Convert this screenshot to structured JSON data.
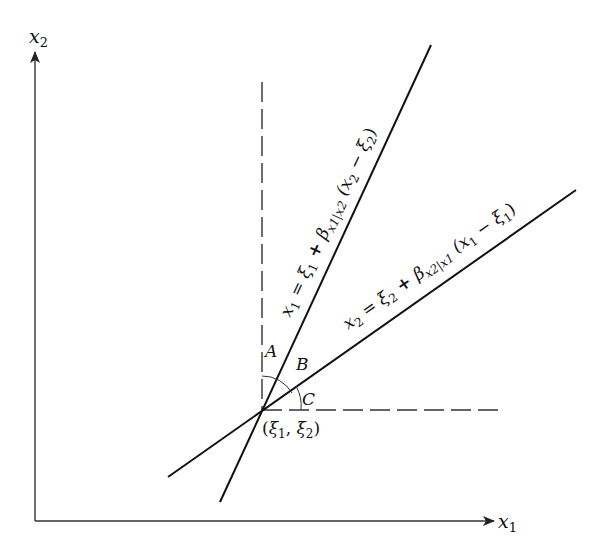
{
  "diagram": {
    "axes": {
      "x_label": "x",
      "x_label_sub": "1",
      "y_label": "x",
      "y_label_sub": "2"
    },
    "point_label": "(ξ1, ξ2)",
    "point_label_parts": {
      "open": "(",
      "xi1": "ξ",
      "sub1": "1",
      "comma": ", ",
      "xi2": "ξ",
      "sub2": "2",
      "close": ")"
    },
    "angles": {
      "A": "A",
      "B": "B",
      "C": "C"
    },
    "line1": {
      "equation": "x1 = ξ1 + βx1|x2 (x2 − ξ2)",
      "parts": {
        "lhs": "x",
        "lhs_sub": "1",
        "eq": " = ",
        "xi": "ξ",
        "xi_sub": "1",
        "plus": " + ",
        "beta": "β",
        "beta_sub": "x1|x2",
        "paren_open": " (x",
        "x_sub": "2",
        "minus": " − ξ",
        "minus_sub": "2",
        "paren_close": ")"
      }
    },
    "line2": {
      "equation": "x2 = ξ2 + βx2|x1 (x1 − ξ1)",
      "parts": {
        "lhs": "x",
        "lhs_sub": "2",
        "eq": " = ",
        "xi": "ξ",
        "xi_sub": "2",
        "plus": " + ",
        "beta": "β",
        "beta_sub": "x2|x1",
        "paren_open": " (x",
        "x_sub": "1",
        "minus": " − ξ",
        "minus_sub": "1",
        "paren_close": ")"
      }
    }
  }
}
